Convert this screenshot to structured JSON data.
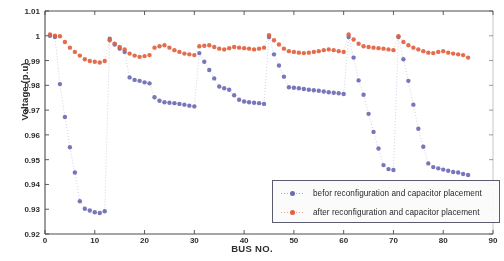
{
  "chart_data": {
    "type": "scatter",
    "title": "",
    "xlabel": "BUS NO.",
    "ylabel": "Voltage (p.u)",
    "xlim": [
      0,
      90
    ],
    "ylim": [
      0.92,
      1.01
    ],
    "xticks": [
      0,
      10,
      20,
      30,
      40,
      50,
      60,
      70,
      80,
      90
    ],
    "yticks": [
      0.92,
      0.93,
      0.94,
      0.95,
      0.96,
      0.97,
      0.98,
      0.99,
      1.0,
      1.01
    ],
    "xtick_labels": [
      "0",
      "10",
      "20",
      "30",
      "40",
      "50",
      "60",
      "70",
      "80",
      "90"
    ],
    "ytick_labels": [
      "0.92",
      "0.93",
      "0.94",
      "0.95",
      "0.96",
      "0.97",
      "0.98",
      "0.99",
      "1",
      "1.01"
    ],
    "grid": false,
    "legend_position": "lower right",
    "marker": "dot",
    "linestyle": "dotted",
    "series": [
      {
        "name": "befor reconfiguration and capacitor placement",
        "color": "#6a6ab4",
        "x": [
          1,
          2,
          3,
          4,
          5,
          6,
          7,
          8,
          9,
          10,
          11,
          12,
          13,
          14,
          15,
          16,
          17,
          18,
          19,
          20,
          21,
          22,
          23,
          24,
          25,
          26,
          27,
          28,
          29,
          30,
          31,
          32,
          33,
          34,
          35,
          36,
          37,
          38,
          39,
          40,
          41,
          42,
          43,
          44,
          45,
          46,
          47,
          48,
          49,
          50,
          51,
          52,
          53,
          54,
          55,
          56,
          57,
          58,
          59,
          60,
          61,
          62,
          63,
          64,
          65,
          66,
          67,
          68,
          69,
          70,
          71,
          72,
          73,
          74,
          75,
          76,
          77,
          78,
          79,
          80,
          81,
          82,
          83,
          84,
          85
        ],
        "values": [
          1.0,
          0.9995,
          0.9805,
          0.9672,
          0.955,
          0.9448,
          0.9332,
          0.9302,
          0.9295,
          0.9288,
          0.9285,
          0.9292,
          0.9988,
          0.9965,
          0.9948,
          0.9935,
          0.9832,
          0.9822,
          0.9818,
          0.9812,
          0.9808,
          0.9752,
          0.9738,
          0.9732,
          0.973,
          0.9728,
          0.9725,
          0.9722,
          0.9718,
          0.9715,
          0.993,
          0.9895,
          0.9862,
          0.9828,
          0.9795,
          0.9788,
          0.9782,
          0.976,
          0.9742,
          0.9735,
          0.9732,
          0.973,
          0.9728,
          0.9725,
          0.9995,
          0.9925,
          0.988,
          0.9835,
          0.9792,
          0.979,
          0.9788,
          0.9785,
          0.9782,
          0.978,
          0.9778,
          0.9775,
          0.9772,
          0.977,
          0.9768,
          0.9765,
          0.9995,
          0.9912,
          0.982,
          0.9762,
          0.9685,
          0.9612,
          0.9545,
          0.9478,
          0.9462,
          0.9458,
          0.9995,
          0.9905,
          0.9818,
          0.9722,
          0.9625,
          0.9552,
          0.9485,
          0.947,
          0.9465,
          0.946,
          0.9455,
          0.945,
          0.9448,
          0.9442,
          0.9438
        ]
      },
      {
        "name": "after reconfiguration and capacitor placement",
        "color": "#e5603c",
        "x": [
          1,
          2,
          3,
          4,
          5,
          6,
          7,
          8,
          9,
          10,
          11,
          12,
          13,
          14,
          15,
          16,
          17,
          18,
          19,
          20,
          21,
          22,
          23,
          24,
          25,
          26,
          27,
          28,
          29,
          30,
          31,
          32,
          33,
          34,
          35,
          36,
          37,
          38,
          39,
          40,
          41,
          42,
          43,
          44,
          45,
          46,
          47,
          48,
          49,
          50,
          51,
          52,
          53,
          54,
          55,
          56,
          57,
          58,
          59,
          60,
          61,
          62,
          63,
          64,
          65,
          66,
          67,
          68,
          69,
          70,
          71,
          72,
          73,
          74,
          75,
          76,
          77,
          78,
          79,
          80,
          81,
          82,
          83,
          84,
          85
        ],
        "values": [
          1.0005,
          1.0,
          0.9998,
          0.9975,
          0.9952,
          0.9935,
          0.992,
          0.9905,
          0.9898,
          0.9895,
          0.9892,
          0.9898,
          0.9982,
          0.9968,
          0.9955,
          0.9945,
          0.9928,
          0.992,
          0.9915,
          0.9918,
          0.9922,
          0.9952,
          0.9958,
          0.9962,
          0.9952,
          0.9942,
          0.9935,
          0.9928,
          0.9925,
          0.9922,
          0.9958,
          0.996,
          0.9962,
          0.9955,
          0.9948,
          0.9945,
          0.995,
          0.9955,
          0.9952,
          0.995,
          0.9948,
          0.9945,
          0.9948,
          0.9952,
          1.0002,
          0.9982,
          0.9965,
          0.9948,
          0.9938,
          0.9935,
          0.9932,
          0.993,
          0.9932,
          0.9935,
          0.9938,
          0.9942,
          0.9945,
          0.9942,
          0.9938,
          0.9935,
          1.0005,
          0.9985,
          0.9968,
          0.9958,
          0.9955,
          0.9952,
          0.995,
          0.9948,
          0.9945,
          0.9942,
          0.9998,
          0.9975,
          0.9962,
          0.9952,
          0.9945,
          0.9938,
          0.9932,
          0.993,
          0.9935,
          0.9938,
          0.9932,
          0.9928,
          0.9925,
          0.9922,
          0.9912
        ]
      }
    ],
    "branch_breaks": [
      12,
      30,
      44,
      60,
      70
    ]
  },
  "legend": {
    "items": [
      {
        "label": "befor reconfiguration and capacitor placement",
        "color": "#6a6ab4"
      },
      {
        "label": "after reconfiguration and capacitor placement",
        "color": "#e5603c"
      }
    ]
  }
}
